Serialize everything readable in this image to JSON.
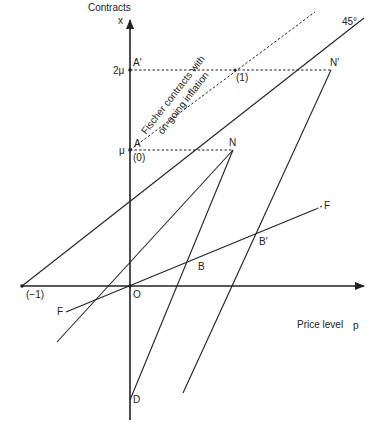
{
  "axes": {
    "y_label": "Contracts",
    "y_symbol": "x",
    "x_label": "Price level",
    "x_symbol": "p"
  },
  "ticks": {
    "y_mu": "μ",
    "y_2mu": "2μ",
    "x_minus1": "(−1)"
  },
  "points": {
    "origin": "O",
    "A": "A",
    "A_prime": "A′",
    "N": "N",
    "N_prime": "N′",
    "B": "B",
    "B_prime": "B′",
    "D": "D",
    "zero": "(0)",
    "one": "(1)"
  },
  "lines": {
    "forty_five": "45°",
    "F_left": "F",
    "F_right": "F"
  },
  "annotation": {
    "line1": "Fischer contracts with",
    "line2": "on-going inflation"
  }
}
